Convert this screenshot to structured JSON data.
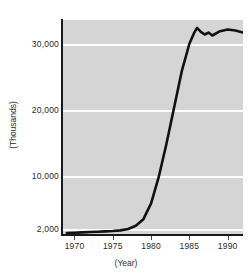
{
  "chart_data": {
    "type": "line",
    "title": "",
    "subtitle": "",
    "xlabel": "(Year)",
    "ylabel": "(Thousands)",
    "xlim": [
      1968.5,
      1992.0
    ],
    "ylim": [
      1200,
      33800
    ],
    "grid": true,
    "legend": null,
    "legend_position": "none",
    "xticks": [
      1970,
      1975,
      1980,
      1985,
      1990
    ],
    "xtick_labels": [
      "1970",
      "1975",
      "1980",
      "1985",
      "1990"
    ],
    "yticks": [
      2000,
      10000,
      20000,
      30000
    ],
    "ytick_labels": [
      "2,000",
      "10,000",
      "20,000",
      "30,000"
    ],
    "series": [
      {
        "name": "",
        "color": "#111111",
        "x": [
          1969.0,
          1970,
          1971,
          1972,
          1973,
          1974,
          1975,
          1976,
          1977,
          1978,
          1979,
          1980,
          1981,
          1982,
          1983,
          1984,
          1985,
          1985.6,
          1986,
          1986.5,
          1987,
          1987.5,
          1988,
          1989,
          1990,
          1991,
          1992
        ],
        "y": [
          1500,
          1550,
          1600,
          1650,
          1700,
          1750,
          1800,
          1900,
          2100,
          2600,
          3600,
          6000,
          10000,
          15000,
          20500,
          26000,
          30200,
          31800,
          32600,
          32000,
          31600,
          31900,
          31450,
          32100,
          32350,
          32200,
          31900
        ]
      }
    ]
  },
  "figure": {
    "background_color": "#ffffff",
    "panel_color": "#d5d5d5",
    "gridline_color": "#fdfdfd",
    "axis_color": "#1a1a1a",
    "line_color": "#111111"
  }
}
